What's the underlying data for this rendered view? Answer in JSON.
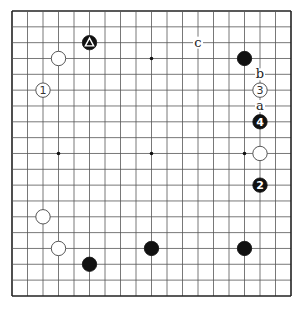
{
  "board": {
    "size": 19,
    "origin_x": 12,
    "origin_y": 11,
    "step_x": 15.5,
    "step_y": 15.83,
    "line_color": "#555555",
    "edge_color": "#222222",
    "background": "#ffffff"
  },
  "star_points": [
    {
      "col": 9,
      "row": 3
    },
    {
      "col": 3,
      "row": 9
    },
    {
      "col": 9,
      "row": 9
    },
    {
      "col": 15,
      "row": 9
    }
  ],
  "stones": [
    {
      "color": "black",
      "col": 5,
      "row": 2,
      "mark": "triangle",
      "label": ""
    },
    {
      "color": "white",
      "col": 3,
      "row": 3,
      "mark": "",
      "label": ""
    },
    {
      "color": "white",
      "col": 2,
      "row": 5,
      "mark": "",
      "label": "1"
    },
    {
      "color": "black",
      "col": 15,
      "row": 3,
      "mark": "",
      "label": ""
    },
    {
      "color": "white",
      "col": 16,
      "row": 5,
      "mark": "",
      "label": "3"
    },
    {
      "color": "black",
      "col": 16,
      "row": 7,
      "mark": "",
      "label": "4"
    },
    {
      "color": "white",
      "col": 16,
      "row": 9,
      "mark": "",
      "label": ""
    },
    {
      "color": "black",
      "col": 16,
      "row": 11,
      "mark": "",
      "label": "2"
    },
    {
      "color": "white",
      "col": 2,
      "row": 13,
      "mark": "",
      "label": ""
    },
    {
      "color": "white",
      "col": 3,
      "row": 15,
      "mark": "",
      "label": ""
    },
    {
      "color": "black",
      "col": 5,
      "row": 16,
      "mark": "",
      "label": ""
    },
    {
      "color": "black",
      "col": 9,
      "row": 15,
      "mark": "",
      "label": ""
    },
    {
      "color": "black",
      "col": 15,
      "row": 15,
      "mark": "",
      "label": ""
    }
  ],
  "letters": [
    {
      "text": "c",
      "col": 12,
      "row": 2
    },
    {
      "text": "b",
      "col": 16,
      "row": 4
    },
    {
      "text": "a",
      "col": 16,
      "row": 6
    }
  ]
}
